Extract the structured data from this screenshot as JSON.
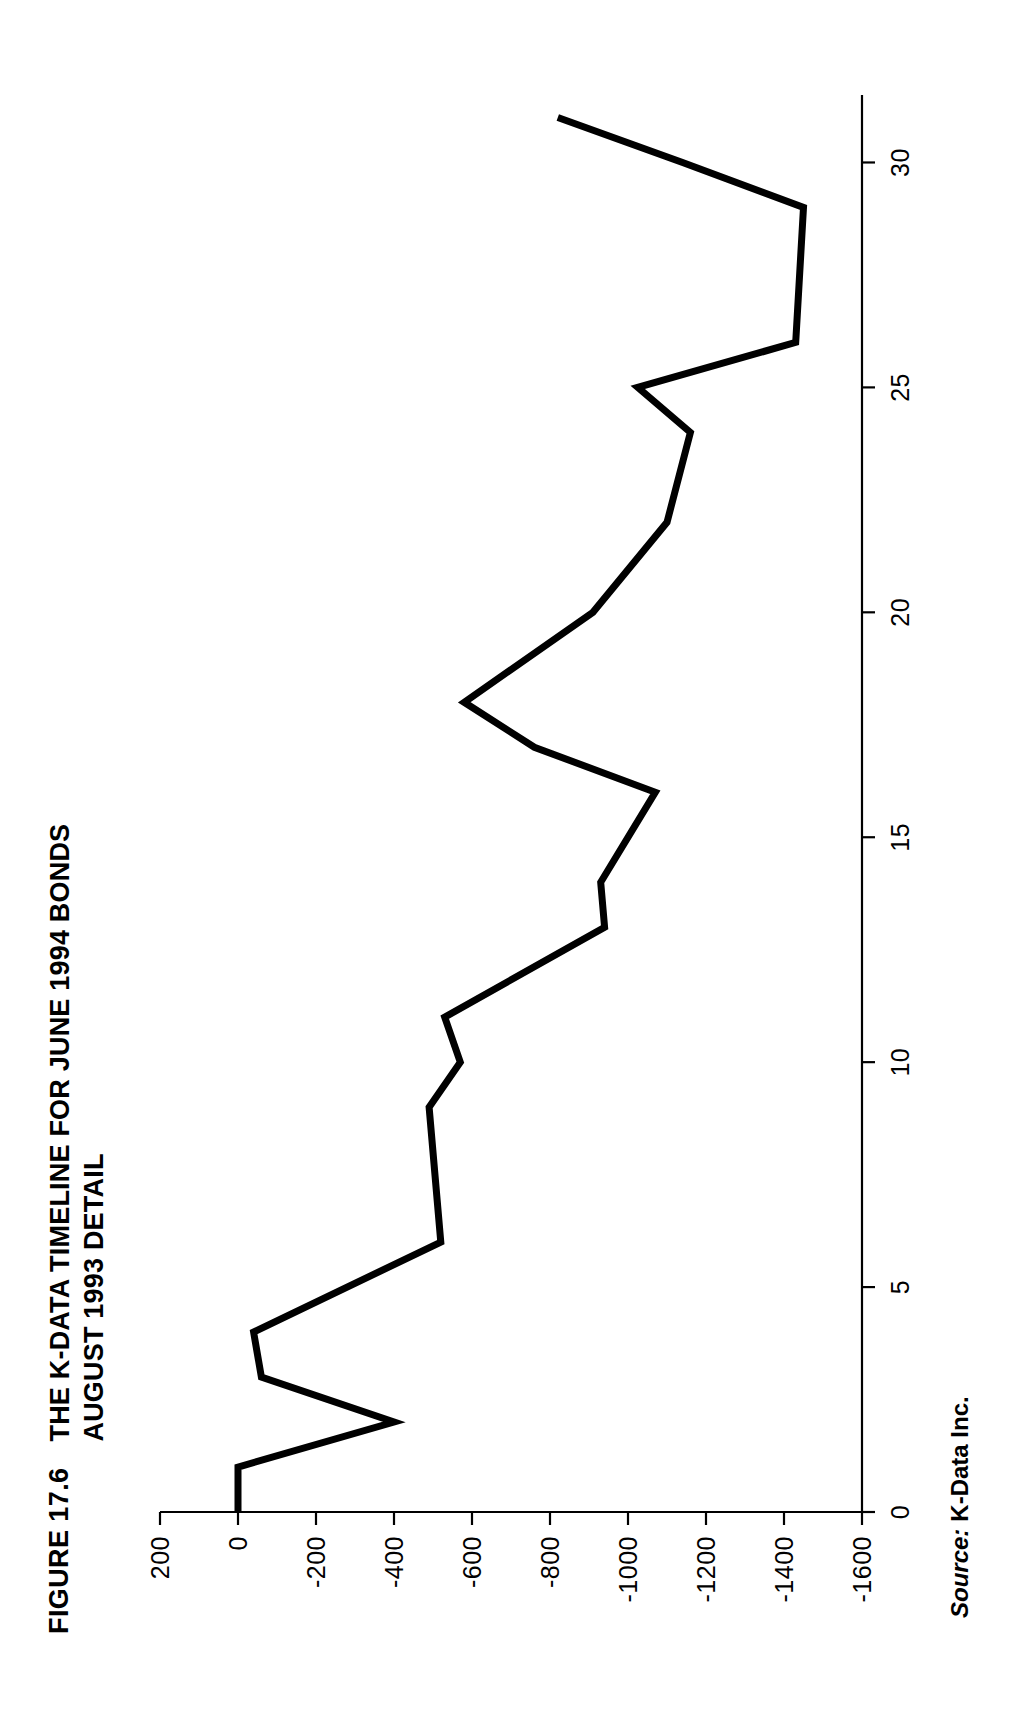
{
  "figure": {
    "number_label": "FIGURE 17.6",
    "title_line1": "THE K-DATA TIMELINE FOR JUNE 1994 BONDS",
    "title_line2": "AUGUST 1993 DETAIL"
  },
  "source": {
    "label": "Source:",
    "value": "K-Data Inc."
  },
  "colors": {
    "line": "#000000",
    "axis": "#000000",
    "background": "#ffffff"
  },
  "chart_data": {
    "type": "line",
    "title": "THE K-DATA TIMELINE FOR JUNE 1994 BONDS AUGUST 1993 DETAIL",
    "xlabel": "",
    "ylabel": "",
    "orientation": "rotated-90-on-page",
    "grid": false,
    "legend": null,
    "xlim": [
      0,
      31.5
    ],
    "ylim": [
      -1600,
      200
    ],
    "xticks": [
      0,
      5,
      10,
      15,
      20,
      25,
      30
    ],
    "xtick_labels": [
      "0",
      "5",
      "10",
      "15",
      "20",
      "25",
      "30"
    ],
    "yticks": [
      200,
      0,
      -200,
      -400,
      -600,
      -800,
      -1000,
      -1200,
      -1400,
      -1600
    ],
    "ytick_labels": [
      "200",
      "0",
      "-200",
      "-400",
      "-600",
      "-800",
      "-1000",
      "-1200",
      "-1400",
      "-1600"
    ],
    "x": [
      0,
      1,
      2,
      3,
      4,
      6,
      9,
      10,
      11,
      13,
      14,
      16,
      17,
      18,
      20,
      22,
      24,
      25,
      26,
      29,
      30,
      31
    ],
    "values": [
      0,
      0,
      -400,
      -60,
      -40,
      -520,
      -490,
      -570,
      -530,
      -940,
      -930,
      -1070,
      -760,
      -580,
      -910,
      -1100,
      -1160,
      -1025,
      -1430,
      -1450,
      -1140,
      -820
    ],
    "series": [
      {
        "name": "K-Data timeline",
        "points": [
          {
            "x": 0,
            "y": 0
          },
          {
            "x": 1,
            "y": 0
          },
          {
            "x": 2,
            "y": -400
          },
          {
            "x": 3,
            "y": -60
          },
          {
            "x": 4,
            "y": -40
          },
          {
            "x": 6,
            "y": -520
          },
          {
            "x": 9,
            "y": -490
          },
          {
            "x": 10,
            "y": -570
          },
          {
            "x": 11,
            "y": -530
          },
          {
            "x": 13,
            "y": -940
          },
          {
            "x": 14,
            "y": -930
          },
          {
            "x": 16,
            "y": -1070
          },
          {
            "x": 17,
            "y": -760
          },
          {
            "x": 18,
            "y": -580
          },
          {
            "x": 20,
            "y": -910
          },
          {
            "x": 22,
            "y": -1100
          },
          {
            "x": 24,
            "y": -1160
          },
          {
            "x": 25,
            "y": -1025
          },
          {
            "x": 26,
            "y": -1430
          },
          {
            "x": 29,
            "y": -1450
          },
          {
            "x": 30,
            "y": -1140
          },
          {
            "x": 31,
            "y": -820
          }
        ]
      }
    ]
  }
}
